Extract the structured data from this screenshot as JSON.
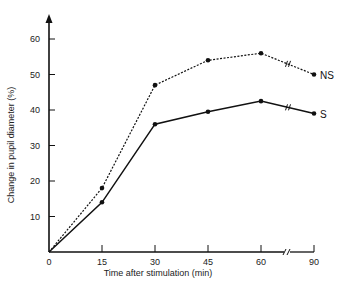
{
  "chart_data": {
    "type": "line",
    "title": "",
    "xlabel": "Time after stimulation (min)",
    "ylabel": "Change in pupil diameter (%)",
    "x": [
      0,
      15,
      30,
      45,
      60,
      90
    ],
    "x_tick_labels": [
      "0",
      "15",
      "30",
      "45",
      "60",
      "90"
    ],
    "y_tick_labels": [
      "10",
      "20",
      "30",
      "40",
      "50",
      "60"
    ],
    "ylim": [
      0,
      65
    ],
    "axis_break": "between 60 and 90 on x-axis and on both series",
    "grid": false,
    "legend": "inline labels at line ends",
    "series": [
      {
        "name": "NS",
        "style": "dotted",
        "values": [
          0,
          18,
          47,
          54,
          56,
          50
        ]
      },
      {
        "name": "S",
        "style": "solid",
        "values": [
          0,
          14,
          36,
          39.5,
          42.5,
          39
        ]
      }
    ]
  }
}
